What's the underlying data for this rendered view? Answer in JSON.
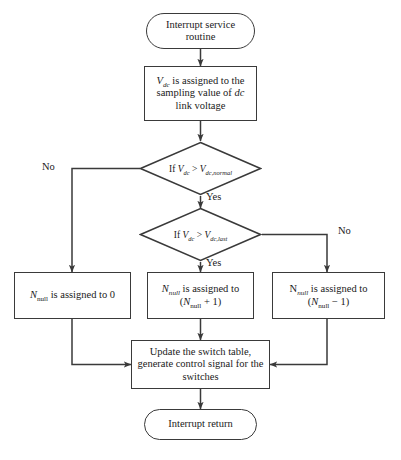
{
  "diagram": {
    "type": "flowchart",
    "stroke_color": "#3a3a3a",
    "text_color": "#1a1a1a",
    "background": "#ffffff"
  },
  "nodes": {
    "start": {
      "shape": "terminal",
      "label": "Interrupt service routine",
      "line1": "Interrupt service",
      "line2": "routine"
    },
    "assign_vdc": {
      "shape": "process",
      "label": "Vdc is assigned to the sampling value of dc link voltage",
      "line1_pre": "",
      "line1_var": "V",
      "line1_sub": "dc",
      "line1_post": " is assigned to the",
      "line2_pre": "sampling value of ",
      "line2_em": "dc",
      "line3": "link voltage"
    },
    "decision_normal": {
      "shape": "decision",
      "label": "If Vdc > Vdc,normal",
      "prefix": "If ",
      "var1": "V",
      "sub1": "dc",
      "operator": " > ",
      "var2": "V",
      "sub2": "dc,normal"
    },
    "decision_last": {
      "shape": "decision",
      "label": "If Vdc > Vdc,last",
      "prefix": "If ",
      "var1": "V",
      "sub1": "dc",
      "operator": " > ",
      "var2": "V",
      "sub2": "dc,last"
    },
    "nnull_zero": {
      "shape": "process",
      "label": "Nnull is assigned to 0",
      "var": "N",
      "sub": "null",
      "text": " is assigned to 0"
    },
    "nnull_inc": {
      "shape": "process",
      "label": "Nnull is assigned to (Nnull + 1)",
      "line1_var": "N",
      "line1_sub": "null",
      "line1_text": " is assigned to",
      "line2_open": "(",
      "line2_var": "N",
      "line2_sub": "null",
      "line2_close": " + 1)"
    },
    "nnull_dec": {
      "shape": "process",
      "label": "Nnull is assigned to (Nnull − 1)",
      "line1_var": "N",
      "line1_sub": "null",
      "line1_text": " is assigned to",
      "line2_open": "(",
      "line2_var": "N",
      "line2_sub": "null",
      "line2_close": " − 1)"
    },
    "update_switch": {
      "shape": "process",
      "label": "Update the switch table, generate control signal for the switches",
      "line1": "Update the switch table,",
      "line2": "generate control signal for the",
      "line3": "switches"
    },
    "end": {
      "shape": "terminal",
      "label": "Interrupt return"
    }
  },
  "edge_labels": {
    "no_left": "No",
    "yes_first": "Yes",
    "no_right": "No",
    "yes_second": "Yes"
  }
}
